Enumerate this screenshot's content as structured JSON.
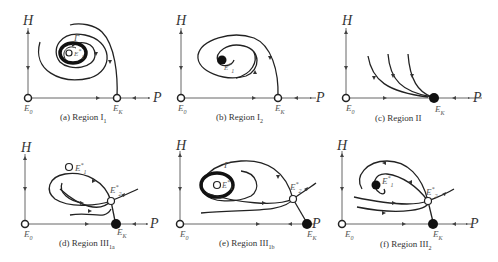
{
  "figure": {
    "axis_labels": {
      "y": "H",
      "x": "P"
    },
    "points": {
      "E0": "E",
      "E0_sub": "0",
      "EK": "E",
      "EK_sub": "K",
      "E1": "E",
      "E1_sub": "1",
      "E2": "E",
      "E2_sub": "2",
      "star": "*"
    },
    "cycle_label": "Γ",
    "panels": [
      {
        "id": "a",
        "caption_prefix": "(a)  Region I",
        "caption_sub": "1"
      },
      {
        "id": "b",
        "caption_prefix": "(b)  Region I",
        "caption_sub": "2"
      },
      {
        "id": "c",
        "caption_prefix": "(c)  Region II",
        "caption_sub": ""
      },
      {
        "id": "d",
        "caption_prefix": "(d)  Region III",
        "caption_sub": "1a"
      },
      {
        "id": "e",
        "caption_prefix": "(e)  Region III",
        "caption_sub": "1b"
      },
      {
        "id": "f",
        "caption_prefix": "(f)  Region III",
        "caption_sub": "2"
      }
    ]
  }
}
